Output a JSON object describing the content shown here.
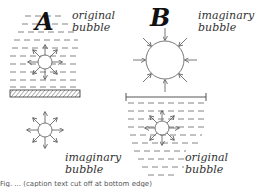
{
  "panels": [
    {
      "id": "A",
      "label": "A",
      "original_label": [
        "original",
        "bubble"
      ],
      "imaginary_label": [
        "imaginary",
        "bubble"
      ],
      "arrows": "outward",
      "boundary": "rigid wall (hatched)"
    },
    {
      "id": "B",
      "label": "B",
      "imaginary_label": [
        "imaginary",
        "bubble"
      ],
      "original_label": [
        "original",
        "bubble"
      ],
      "arrows_imaginary": "inward",
      "arrows_original": "outward",
      "boundary": "free surface (line)"
    }
  ],
  "caption": "Fig. ... (caption text cut off at bottom edge)",
  "colors": {
    "ink": "#333333",
    "background": "#ffffff"
  }
}
